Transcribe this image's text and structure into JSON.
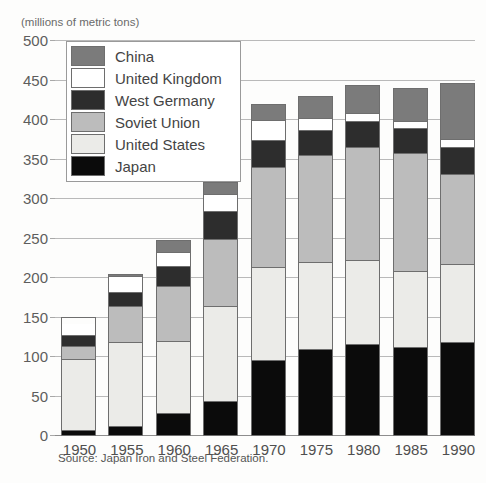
{
  "header": {
    "faded_top_text": "",
    "unit_label": "(millions of metric tons)"
  },
  "source": {
    "text": "Source: Japan Iron and Steel Federation."
  },
  "legend": {
    "position": "top-left-inside",
    "items": [
      {
        "label": "China",
        "color": "#7b7b7b",
        "key": "china"
      },
      {
        "label": "United Kingdom",
        "color": "#ffffff",
        "key": "uk"
      },
      {
        "label": "West Germany",
        "color": "#2d2d2d",
        "key": "wger"
      },
      {
        "label": "Soviet Union",
        "color": "#bcbcbc",
        "key": "soviet"
      },
      {
        "label": "United States",
        "color": "#ebebe8",
        "key": "us"
      },
      {
        "label": "Japan",
        "color": "#0b0b0b",
        "key": "japan"
      }
    ]
  },
  "axes": {
    "y_ticks": [
      "0",
      "50",
      "100",
      "150",
      "200",
      "250",
      "300",
      "350",
      "400",
      "450",
      "500"
    ],
    "x_ticks": [
      "1950",
      "1955",
      "1960",
      "1965",
      "1970",
      "1975",
      "1980",
      "1985",
      "1990"
    ]
  },
  "chart_data": {
    "type": "bar",
    "subtype": "stacked-vertical",
    "title": "",
    "subtitle": "",
    "xlabel": "",
    "ylabel": "(millions of metric tons)",
    "ylim": [
      0,
      500
    ],
    "ytick_step": 50,
    "grid": true,
    "legend_position": "inside top-left",
    "categories": [
      "1950",
      "1955",
      "1960",
      "1965",
      "1970",
      "1975",
      "1980",
      "1985",
      "1990"
    ],
    "stack_order_bottom_to_top": [
      "Japan",
      "United States",
      "Soviet Union",
      "West Germany",
      "United Kingdom",
      "China"
    ],
    "series": [
      {
        "name": "Japan",
        "color": "#0b0b0b",
        "values": [
          5,
          10,
          27,
          42,
          94,
          108,
          115,
          111,
          117
        ]
      },
      {
        "name": "United States",
        "color": "#ebebe8",
        "values": [
          90,
          108,
          92,
          121,
          119,
          111,
          107,
          96,
          100
        ]
      },
      {
        "name": "Soviet Union",
        "color": "#bcbcbc",
        "values": [
          16,
          46,
          70,
          86,
          127,
          136,
          143,
          151,
          114
        ]
      },
      {
        "name": "West Germany",
        "color": "#2d2d2d",
        "values": [
          14,
          18,
          26,
          35,
          35,
          32,
          34,
          32,
          34
        ]
      },
      {
        "name": "United Kingdom",
        "color": "#ffffff",
        "values": [
          16,
          20,
          18,
          22,
          25,
          15,
          10,
          8,
          10
        ]
      },
      {
        "name": "China",
        "color": "#7b7b7b",
        "values": [
          0,
          3,
          15,
          16,
          20,
          29,
          35,
          43,
          72
        ]
      }
    ],
    "totals": [
      151,
      205,
      248,
      322,
      420,
      431,
      444,
      441,
      447
    ]
  }
}
